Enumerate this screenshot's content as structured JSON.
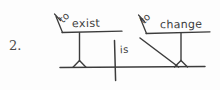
{
  "document": {
    "kind": "handwritten sentence diagram",
    "item_number": "2.",
    "sentence": "To exist is to change",
    "ink_color": "#3c3c3c",
    "paper_color": "#fdfdfd"
  },
  "diagram": {
    "subject_phrase": {
      "particle": "to",
      "word": "exist"
    },
    "verb": "is",
    "complement_phrase": {
      "particle": "to",
      "word": "change"
    }
  },
  "labels": {
    "to_left": "to",
    "exist": "exist",
    "is": "is",
    "to_right": "to",
    "change": "change"
  }
}
